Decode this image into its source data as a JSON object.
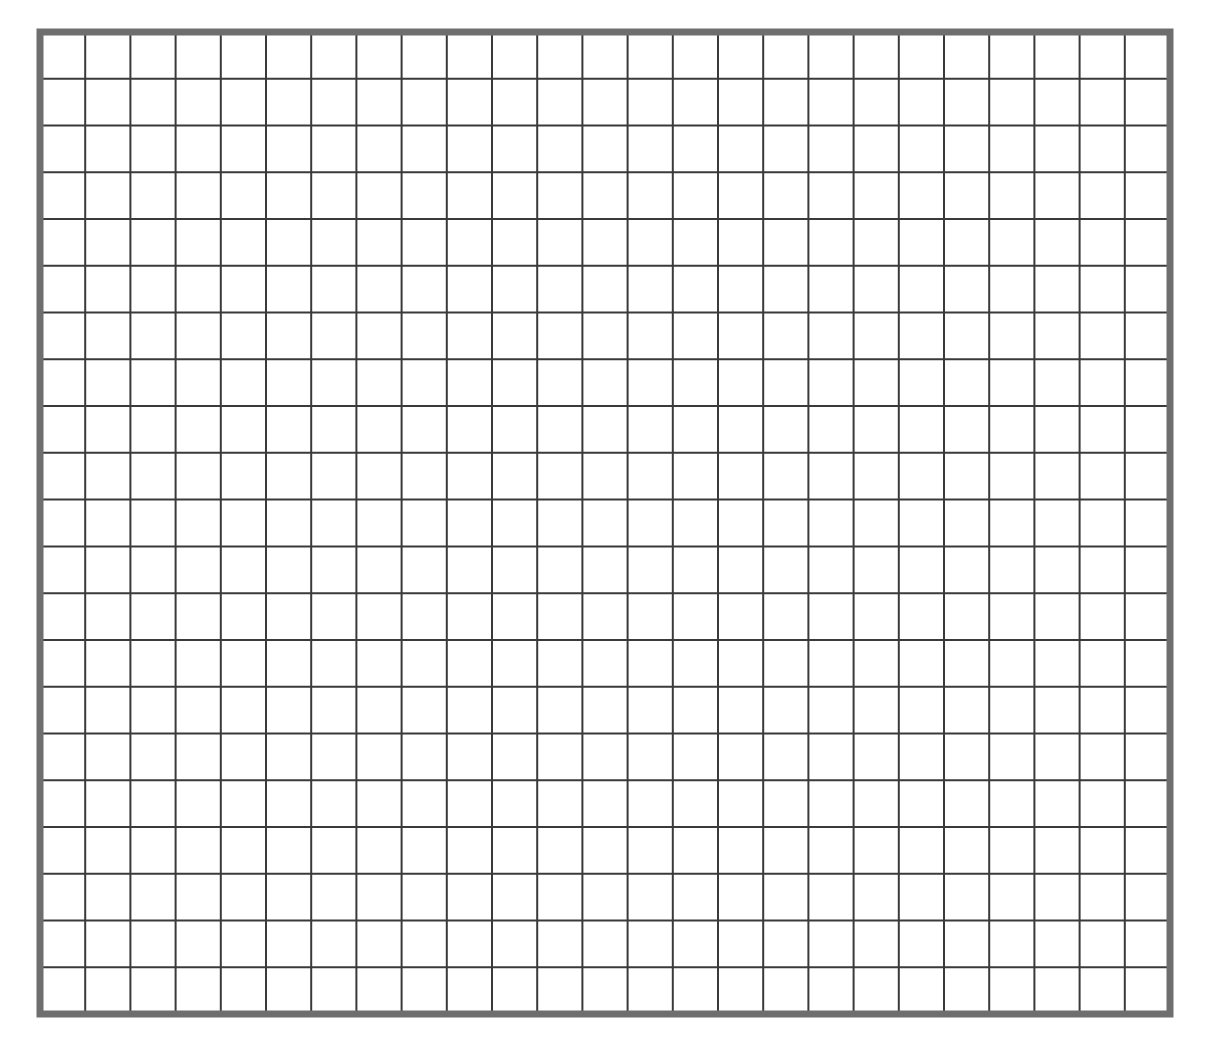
{
  "grid": {
    "columns": 25,
    "rows": 21,
    "border_color": "#6e6e6e",
    "line_color": "#3a3a3a",
    "background_color": "#ffffff"
  }
}
